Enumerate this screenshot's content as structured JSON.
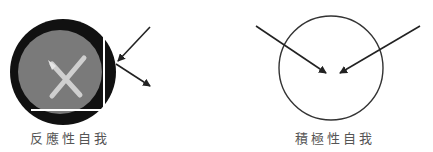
{
  "diagrams": {
    "left": {
      "label": "反應性自我",
      "outer_color": "#111111",
      "inner_color": "#7a7a7a",
      "cross_color": "#cfcfcf",
      "arrows": [
        "incoming",
        "outgoing"
      ]
    },
    "right": {
      "label": "積極性自我",
      "stroke_color": "#333333",
      "arrows": [
        "incoming-from-left",
        "incoming-from-right"
      ]
    }
  }
}
